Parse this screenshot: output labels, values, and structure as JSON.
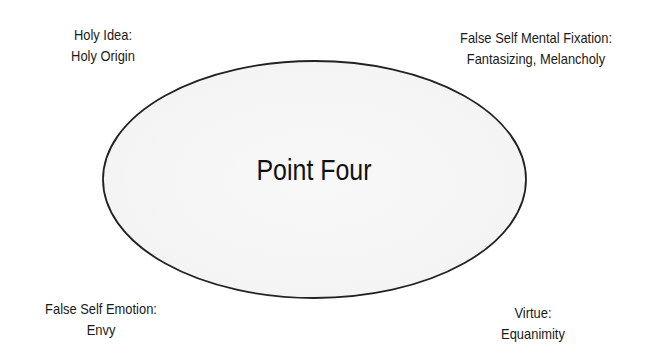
{
  "diagram": {
    "center": {
      "label": "Point Four",
      "shape": "ellipse",
      "fill": "#f6f6f6",
      "stroke": "#222222"
    },
    "corners": {
      "top_left": {
        "line1": "Holy Idea:",
        "line2": "Holy Origin"
      },
      "top_right": {
        "line1": "False Self Mental Fixation:",
        "line2": "Fantasizing, Melancholy"
      },
      "bottom_left": {
        "line1": "False Self Emotion:",
        "line2": "Envy"
      },
      "bottom_right": {
        "line1": "Virtue:",
        "line2": "Equanimity"
      }
    }
  }
}
